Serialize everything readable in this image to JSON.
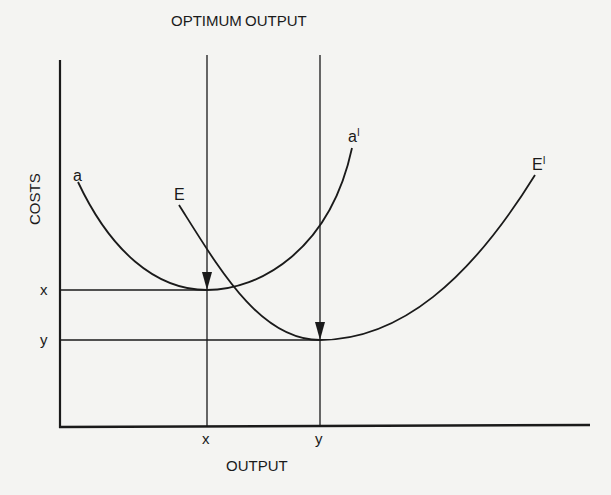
{
  "figure": {
    "title_top": {
      "word1": "OPTIMUM",
      "word2": "OUTPUT"
    },
    "y_axis_label": "COSTS",
    "x_axis_label": "OUTPUT",
    "curves": [
      {
        "start_label": "a",
        "end_label": "aˡ",
        "end_label_text": "a",
        "end_label_sup": "I",
        "description": "average cost curve, smaller optimum"
      },
      {
        "start_label": "E",
        "end_label_text": "E",
        "end_label_sup": "I",
        "description": "average cost curve, larger optimum"
      }
    ],
    "cost_ticks": [
      "x",
      "y"
    ],
    "output_ticks": [
      "x",
      "y"
    ],
    "colors": {
      "ink": "#1a1a1a",
      "paper": "#f4f4f2",
      "bleed_through": "#d8d8d6"
    }
  }
}
